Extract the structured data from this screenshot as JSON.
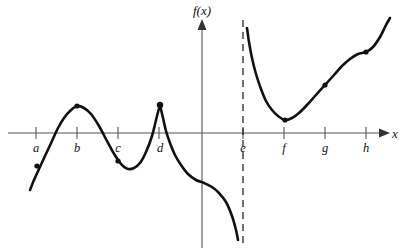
{
  "figure": {
    "y_axis_label": "f(x)",
    "x_axis_label": "x"
  },
  "chart_data": {
    "type": "line",
    "xlabel": "x",
    "ylabel": "f(x)",
    "grid": false,
    "legend": false,
    "axis_origin_px": {
      "x": 202,
      "y": 133
    },
    "xlim_px": [
      8,
      385
    ],
    "ylim_px": [
      18,
      248
    ],
    "tick_labels": [
      "a",
      "b",
      "c",
      "d",
      "e",
      "f",
      "g",
      "h"
    ],
    "tick_positions_px": [
      36,
      77,
      118,
      159,
      243,
      284,
      325,
      366
    ],
    "asymptote": {
      "kind": "vertical",
      "at_label": "e",
      "x_px": 243,
      "style": "dashed"
    },
    "branches": [
      {
        "name": "left-branch",
        "description": "rises from lower left, local max at b, local min between c and d, sharp cusp corner at d, then decreasing with an inflection near the y-axis down toward the asymptote",
        "points_px": [
          [
            30,
            190
          ],
          [
            34,
            180
          ],
          [
            39,
            169
          ],
          [
            45,
            156
          ],
          [
            52,
            141
          ],
          [
            58,
            128
          ],
          [
            64,
            118
          ],
          [
            70,
            111
          ],
          [
            77,
            106
          ],
          [
            84,
            108
          ],
          [
            91,
            114
          ],
          [
            99,
            126
          ],
          [
            107,
            141
          ],
          [
            113,
            152
          ],
          [
            118,
            160
          ],
          [
            123,
            166
          ],
          [
            128,
            169
          ],
          [
            134,
            168
          ],
          [
            140,
            163
          ],
          [
            146,
            152
          ],
          [
            152,
            136
          ],
          [
            157,
            116
          ],
          [
            160,
            105
          ],
          [
            163,
            118
          ],
          [
            166,
            131
          ],
          [
            170,
            143
          ],
          [
            175,
            155
          ],
          [
            181,
            165
          ],
          [
            188,
            174
          ],
          [
            196,
            180
          ],
          [
            204,
            183
          ],
          [
            212,
            187
          ],
          [
            219,
            193
          ],
          [
            226,
            202
          ],
          [
            232,
            216
          ],
          [
            236,
            230
          ],
          [
            238,
            240
          ]
        ]
      },
      {
        "name": "right-branch",
        "description": "falls steeply from near the vertical asymptote at e, local min just right of f, then increases through g and h with an inflection",
        "points_px": [
          [
            247,
            28
          ],
          [
            249,
            42
          ],
          [
            252,
            58
          ],
          [
            256,
            74
          ],
          [
            261,
            89
          ],
          [
            266,
            101
          ],
          [
            272,
            110
          ],
          [
            278,
            116
          ],
          [
            285,
            120
          ],
          [
            292,
            118
          ],
          [
            299,
            113
          ],
          [
            307,
            105
          ],
          [
            315,
            96
          ],
          [
            325,
            85
          ],
          [
            334,
            75
          ],
          [
            342,
            66
          ],
          [
            350,
            59
          ],
          [
            358,
            54
          ],
          [
            366,
            52
          ],
          [
            373,
            47
          ],
          [
            380,
            37
          ],
          [
            386,
            25
          ],
          [
            390,
            18
          ]
        ]
      }
    ],
    "marked_points_px": [
      {
        "name": "point-on-rising-left",
        "near_label": "a",
        "x": 37,
        "y": 166,
        "kind": "point"
      },
      {
        "name": "local-maximum",
        "near_label": "b",
        "x": 77,
        "y": 106,
        "kind": "local-max"
      },
      {
        "name": "point-on-falling-left",
        "near_label": "c",
        "x": 118,
        "y": 161,
        "kind": "point"
      },
      {
        "name": "cusp-corner",
        "near_label": "d",
        "x": 160,
        "y": 105,
        "kind": "corner"
      },
      {
        "name": "local-minimum-right",
        "near_label": "f",
        "x": 285,
        "y": 120,
        "kind": "local-min"
      },
      {
        "name": "point-on-rising-right",
        "near_label": "g",
        "x": 325,
        "y": 85,
        "kind": "point"
      },
      {
        "name": "inflection-right",
        "near_label": "h",
        "x": 366,
        "y": 52,
        "kind": "inflection"
      }
    ]
  },
  "colors": {
    "curve": "#111111",
    "axis": "#555555",
    "asymptote": "#222222",
    "background": "#ffffff"
  }
}
